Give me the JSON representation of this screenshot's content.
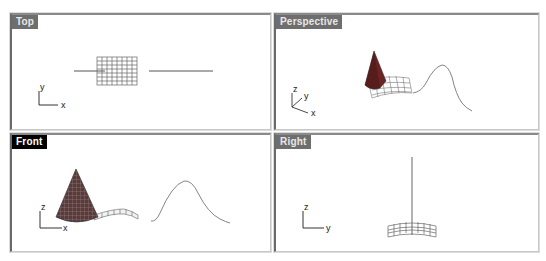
{
  "viewports": [
    {
      "id": "top",
      "label": "Top",
      "active": false,
      "axes": {
        "vertical": "y",
        "horizontal": "x"
      },
      "objects": [
        "surface-grid",
        "curve-line-left",
        "curve-line-right"
      ]
    },
    {
      "id": "perspective",
      "label": "Perspective",
      "active": false,
      "axes": {
        "vertical": "z",
        "depth": "y",
        "horizontal": "x"
      },
      "objects": [
        "cone",
        "surface-mesh",
        "bell-curve"
      ]
    },
    {
      "id": "front",
      "label": "Front",
      "active": true,
      "axes": {
        "vertical": "z",
        "horizontal": "x"
      },
      "objects": [
        "cone",
        "surface-strip",
        "bell-curve"
      ]
    },
    {
      "id": "right",
      "label": "Right",
      "active": false,
      "axes": {
        "vertical": "z",
        "horizontal": "y"
      },
      "objects": [
        "vertical-line",
        "surface-arc"
      ]
    }
  ],
  "colors": {
    "label_inactive_bg": "#6e6e6e",
    "label_active_bg": "#000000",
    "geometry": "#555555",
    "cone_fill": "#7a2a2a"
  }
}
